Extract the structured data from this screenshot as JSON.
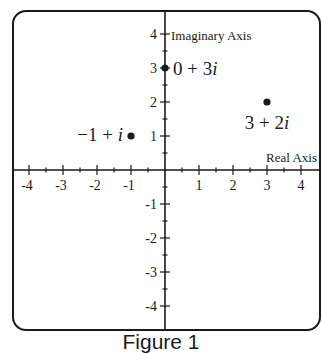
{
  "chart_data": {
    "type": "scatter",
    "title": "",
    "caption": "Figure 1",
    "xlabel": "Real Axis",
    "ylabel": "Imaginary Axis",
    "xlim": [
      -4.3,
      4.3
    ],
    "ylim": [
      -4.3,
      4.3
    ],
    "grid": false,
    "x_ticks": [
      -4,
      -3,
      -2,
      -1,
      1,
      2,
      3,
      4
    ],
    "y_ticks": [
      -4,
      -3,
      -2,
      -1,
      1,
      2,
      3,
      4
    ],
    "minor_tick_step": 0.5,
    "points": [
      {
        "x": -1,
        "y": 1,
        "label": "−1 + i"
      },
      {
        "x": 0,
        "y": 3,
        "label": "0 + 3i"
      },
      {
        "x": 3,
        "y": 2,
        "label": "3 + 2i"
      }
    ]
  },
  "figure": {
    "caption": "Figure 1",
    "x_axis_label": "Real Axis",
    "y_axis_label": "Imaginary Axis",
    "colors": {
      "ink": "#1a1a1a",
      "background": "#ffffff"
    }
  }
}
